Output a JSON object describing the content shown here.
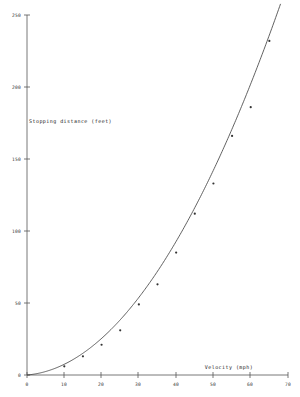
{
  "chart_data": {
    "type": "scatter",
    "title": "",
    "subtitle": "",
    "xlabel": "Velocity (mph)",
    "ylabel": "Stopping distance (feet)",
    "xlim": [
      0,
      70
    ],
    "ylim": [
      0,
      250
    ],
    "xticks": [
      0,
      10,
      20,
      30,
      40,
      50,
      60,
      70
    ],
    "yticks": [
      0,
      50,
      100,
      150,
      200,
      250
    ],
    "xtick_labels": [
      "0",
      "10",
      "20",
      "30",
      "40",
      "50",
      "60",
      "70"
    ],
    "ytick_labels": [
      "0",
      "50",
      "100",
      "150",
      "200",
      "250"
    ],
    "grid": false,
    "legend": null,
    "legend_position": "none",
    "marker": "dot",
    "series": [
      {
        "name": "Observed stopping distance",
        "type": "scatter",
        "x": [
          10,
          15,
          20,
          25,
          30,
          35,
          40,
          45,
          50,
          55,
          60,
          65
        ],
        "y": [
          6,
          13,
          21,
          31,
          49,
          63,
          85,
          112,
          133,
          166,
          186,
          232
        ]
      },
      {
        "name": "Fitted curve",
        "type": "line",
        "fit": "quadratic",
        "equation_a": 0.0525,
        "equation_b": 0.22,
        "equation_c": 0,
        "x_start": 0,
        "x_end": 68
      }
    ]
  },
  "axes": {
    "x_title": "Velocity (mph)",
    "y_title": "Stopping distance (feet)"
  },
  "colors": {
    "axis": "#555555",
    "curve": "#444444",
    "point": "#333333",
    "text": "#222222",
    "background": "#ffffff"
  }
}
